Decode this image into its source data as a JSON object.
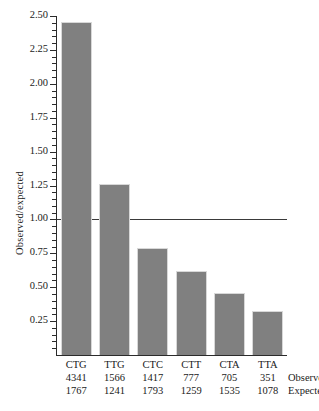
{
  "chart_data": {
    "type": "bar",
    "title": "",
    "xlabel": "",
    "ylabel": "Observed/expected",
    "categories": [
      "CTG",
      "TTG",
      "CTC",
      "CTT",
      "CTA",
      "TTA"
    ],
    "values": [
      2.456,
      1.262,
      0.79,
      0.617,
      0.459,
      0.326
    ],
    "ylim": [
      0,
      2.5
    ],
    "grid": false,
    "legend": false,
    "reference_line": {
      "value": 1.0,
      "orientation": "horizontal"
    },
    "axis": {
      "y_ticks": [
        0.25,
        0.5,
        0.75,
        1.0,
        1.25,
        1.5,
        1.75,
        2.0,
        2.25,
        2.5
      ],
      "y_tick_labels": [
        "0.25",
        "0.50",
        "0.75",
        "1.00",
        "1.25",
        "1.50",
        "1.75",
        "2.00",
        "2.25",
        "2.50"
      ],
      "y_minor_tick_step": 0.05
    },
    "series": [
      {
        "name": "Observed",
        "values": [
          4341,
          1566,
          1417,
          777,
          705,
          351
        ]
      },
      {
        "name": "Expected",
        "values": [
          1767,
          1241,
          1793,
          1259,
          1535,
          1078
        ]
      }
    ],
    "row_labels": {
      "observed": "Observed",
      "expected": "Expected"
    },
    "colors": {
      "bar_fill": "#808080",
      "bar_edge": "#d8d8d8",
      "axis": "#2b2b2b",
      "reference_line": "#3a3a3a",
      "text": "#1a1a1a",
      "background": "#ffffff"
    }
  }
}
